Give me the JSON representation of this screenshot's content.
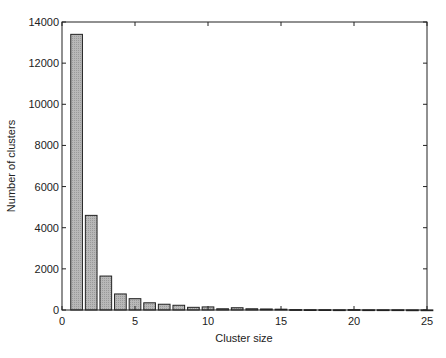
{
  "chart_data": {
    "type": "bar",
    "title": "",
    "xlabel": "Cluster size",
    "ylabel": "Number of clusters",
    "xlim": [
      0,
      25
    ],
    "ylim": [
      0,
      14000
    ],
    "grid": false,
    "legend": null,
    "x_ticks": [
      0,
      5,
      10,
      15,
      20,
      25
    ],
    "y_ticks": [
      0,
      2000,
      4000,
      6000,
      8000,
      10000,
      12000,
      14000
    ],
    "categories": [
      1,
      2,
      3,
      4,
      5,
      6,
      7,
      8,
      9,
      10,
      11,
      12,
      13,
      14,
      15,
      16,
      17,
      18,
      19,
      20,
      21,
      22,
      23,
      24,
      25
    ],
    "values": [
      13400,
      4600,
      1650,
      780,
      550,
      350,
      280,
      230,
      130,
      150,
      60,
      110,
      60,
      50,
      40,
      20,
      15,
      15,
      10,
      20,
      10,
      10,
      10,
      5,
      5
    ],
    "bar_fill": "#b8b8b8",
    "bar_edge": "#222222"
  }
}
